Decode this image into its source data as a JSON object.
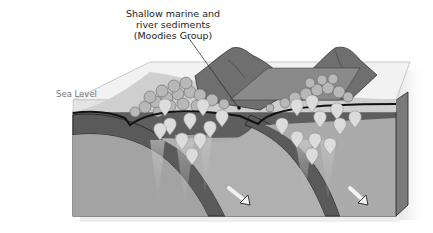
{
  "diagram": {
    "type": "geological block diagram (subduction zones)",
    "labels": {
      "sediments": {
        "line1": "Shallow marine and",
        "line2": "river sediments",
        "line3": "(Moodies Group)"
      },
      "sea_level": "Sea Level"
    },
    "colors": {
      "background": "#ffffff",
      "water": "#e8e8e8",
      "crust_dark": "#5a5a5a",
      "mantle": "#a8a8a8",
      "mountain": "#6e6e6e",
      "magma_drop": "#d8d8d8",
      "outline": "#111111"
    },
    "features": [
      "two subducting slabs",
      "two volcanic mountain ranges",
      "magma plumes (teardrop shapes)",
      "two motion arrows"
    ]
  }
}
